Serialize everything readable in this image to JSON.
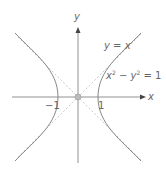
{
  "figure": {
    "type": "hyperbola diagram",
    "axes": {
      "x_label": "x",
      "y_label": "y"
    },
    "ticks": {
      "neg_one": "−1",
      "one": "1"
    },
    "asymptote_label": "y = x",
    "curve_label": {
      "lhs_x": "x",
      "exp1": "2",
      "minus": " − y",
      "exp2": "2",
      "rhs": " = 1"
    },
    "colors": {
      "axis": "#777777",
      "curve": "#888888",
      "asymptote": "#bbbbbb",
      "text": "#666666"
    }
  }
}
